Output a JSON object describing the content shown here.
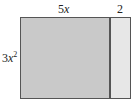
{
  "diagram": {
    "labels": {
      "top_width_coef": "5",
      "top_width_var": "x",
      "side_width": "2",
      "height_coef": "3",
      "height_var": "x",
      "height_exp": "2"
    },
    "colors": {
      "main_fill": "#c9c9c9",
      "side_fill": "#e7e7e7",
      "border": "#555555"
    }
  }
}
